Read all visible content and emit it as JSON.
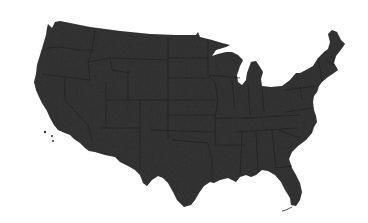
{
  "map": {
    "subject": "Contiguous United States silhouette",
    "colors": {
      "background": "#ffffff",
      "land_fill": "#343434",
      "state_borders": "#1f1f1f"
    },
    "features": [
      "us-landmass",
      "great-lakes",
      "state-borders",
      "florida-peninsula",
      "new-england"
    ]
  }
}
